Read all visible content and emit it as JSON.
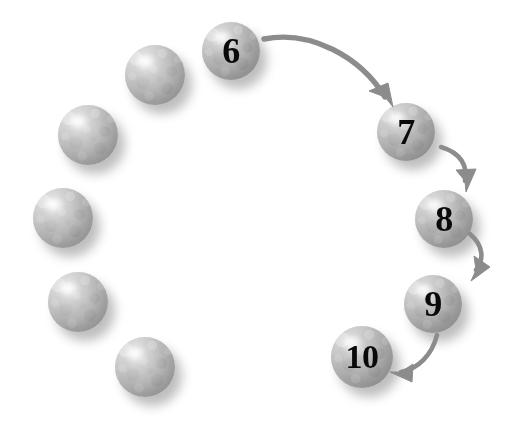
{
  "canvas": {
    "width": 515,
    "height": 434,
    "background": "#ffffff",
    "title": "Circular sphere sequence with numbered steps 6 to 10"
  },
  "style": {
    "sphere_fill_light": "#c3c3c3",
    "sphere_fill_dark": "#b4b4b4",
    "sphere_highlight": "#f2f2f2",
    "sphere_shadow": "rgba(0,0,0,0.26)",
    "label_color": "#0a0a0a",
    "arrow_color": "#8c8c8c"
  },
  "spheres": [
    {
      "id": "sphere-1",
      "label": "",
      "numbered": false,
      "cx": 145,
      "cy": 367,
      "r": 30,
      "font_size": 0
    },
    {
      "id": "sphere-2",
      "label": "",
      "numbered": false,
      "cx": 78,
      "cy": 302,
      "r": 30,
      "font_size": 0
    },
    {
      "id": "sphere-3",
      "label": "",
      "numbered": false,
      "cx": 63,
      "cy": 218,
      "r": 30,
      "font_size": 0
    },
    {
      "id": "sphere-4",
      "label": "",
      "numbered": false,
      "cx": 88,
      "cy": 135,
      "r": 30,
      "font_size": 0
    },
    {
      "id": "sphere-5",
      "label": "",
      "numbered": false,
      "cx": 155,
      "cy": 75,
      "r": 30,
      "font_size": 0
    },
    {
      "id": "sphere-6",
      "label": "6",
      "numbered": true,
      "cx": 231,
      "cy": 51,
      "r": 29,
      "font_size": 36
    },
    {
      "id": "sphere-7",
      "label": "7",
      "numbered": true,
      "cx": 406,
      "cy": 132,
      "r": 29,
      "font_size": 36
    },
    {
      "id": "sphere-8",
      "label": "8",
      "numbered": true,
      "cx": 444,
      "cy": 219,
      "r": 29,
      "font_size": 36
    },
    {
      "id": "sphere-9",
      "label": "9",
      "numbered": true,
      "cx": 433,
      "cy": 304,
      "r": 29,
      "font_size": 36
    },
    {
      "id": "sphere-10",
      "label": "10",
      "numbered": true,
      "cx": 362,
      "cy": 357,
      "r": 31,
      "font_size": 34
    }
  ],
  "arrows": [
    {
      "id": "arrow-6-to-7",
      "from": "6",
      "to": "7",
      "path": "M 264,39 C 310,30 360,56 385,97",
      "head": "M 385,97 L 369,91 L 388,83 L 393,107 Z",
      "width": 5.4
    },
    {
      "id": "arrow-7-to-8",
      "from": "7",
      "to": "8",
      "path": "M 441,147 C 461,153 468,166 465,181",
      "head": "M 465,181 L 456,170 L 476,169 L 466,192 Z",
      "width": 4.6
    },
    {
      "id": "arrow-8-to-9",
      "from": "8",
      "to": "9",
      "path": "M 470,234 C 484,246 484,260 476,270",
      "head": "M 476,270 L 474,256 L 490,267 L 471,281 Z",
      "width": 4.6
    },
    {
      "id": "arrow-9-to-10",
      "from": "9",
      "to": "10",
      "path": "M 437,335 C 432,355 418,369 401,372",
      "head": "M 401,372 L 413,364 L 412,382 L 390,372 Z",
      "width": 4.6
    }
  ],
  "chart_data": {
    "type": "diagram",
    "sequence": [
      "6",
      "7",
      "8",
      "9",
      "10"
    ],
    "unlabelled_count": 5,
    "total_spheres": 10,
    "flow_direction": "clockwise",
    "connections": [
      {
        "from": "6",
        "to": "7"
      },
      {
        "from": "7",
        "to": "8"
      },
      {
        "from": "8",
        "to": "9"
      },
      {
        "from": "9",
        "to": "10"
      }
    ]
  }
}
